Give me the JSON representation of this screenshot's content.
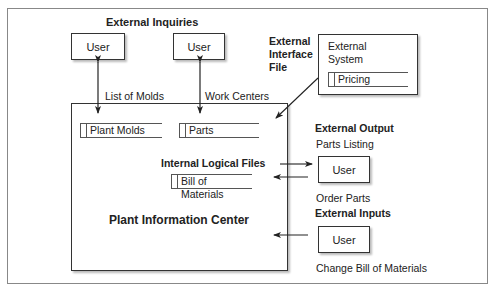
{
  "labels": {
    "external_inquiries": "External Inquiries",
    "external_interface_file": [
      "External",
      "Interface",
      "File"
    ],
    "list_of_molds": "List of Molds",
    "work_centers": "Work Centers",
    "internal_logical_files": "Internal Logical Files",
    "plant_information_center": "Plant Information Center",
    "external_output": "External Output",
    "parts_listing": "Parts Listing",
    "order_parts": "Order Parts",
    "external_inputs": "External Inputs",
    "change_bill_of_materials": "Change Bill of Materials"
  },
  "users": {
    "inquiry_user_1": "User",
    "inquiry_user_2": "User",
    "output_user": "User",
    "input_user": "User"
  },
  "external_system": {
    "title_line1": "External",
    "title_line2": "System",
    "file": "Pricing"
  },
  "stores": {
    "plant_molds": "Plant Molds",
    "parts": "Parts",
    "bill_of_materials": "Bill of Materials"
  }
}
